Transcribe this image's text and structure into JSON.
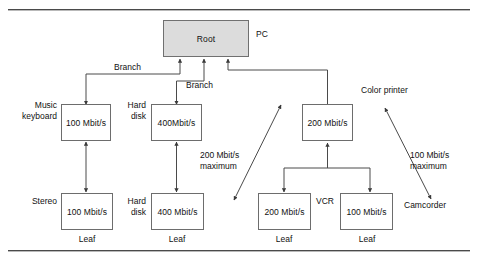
{
  "figure": {
    "colors": {
      "root_fill": "#dcdcdc",
      "box_stroke": "#6d6d6d",
      "line": "#4a4a4a",
      "text": "#111111",
      "background": "#ffffff"
    },
    "rules": [
      {
        "name": "top-rule",
        "y": 9
      },
      {
        "name": "bottom-rule",
        "y": 250
      }
    ]
  },
  "nodes": {
    "root": {
      "label": "Root",
      "x": 163,
      "y": 20,
      "w": 86,
      "h": 37
    },
    "music_keyboard": {
      "label": "100 Mbit/s",
      "x": 61,
      "y": 104,
      "w": 50,
      "h": 37
    },
    "hard_disk_top": {
      "label": "400Mbit/s",
      "x": 151,
      "y": 104,
      "w": 51,
      "h": 37
    },
    "hub_200": {
      "label": "200 Mbit/s",
      "x": 302,
      "y": 104,
      "w": 51,
      "h": 37
    },
    "stereo": {
      "label": "100 Mbit/s",
      "x": 61,
      "y": 193,
      "w": 52,
      "h": 37
    },
    "hard_disk_bottom": {
      "label": "400 Mbit/s",
      "x": 151,
      "y": 193,
      "w": 53,
      "h": 37
    },
    "vcr": {
      "label": "200 Mbit/s",
      "x": 258,
      "y": 193,
      "w": 53,
      "h": 37
    },
    "camcorder_leaf": {
      "label": "100 Mbit/s",
      "x": 340,
      "y": 193,
      "w": 53,
      "h": 37
    }
  },
  "annotations": {
    "pc": {
      "text": "PC",
      "x": 256,
      "y": 29
    },
    "branch_1": {
      "text": "Branch",
      "x": 114,
      "y": 62
    },
    "branch_2": {
      "text": "Branch",
      "x": 186,
      "y": 80
    },
    "music_keyboard_label": {
      "line1": "Music",
      "line2": "keyboard",
      "x": 9,
      "y": 100
    },
    "hard_disk_top_label": {
      "line1": "Hard",
      "line2": "disk",
      "x": 122,
      "y": 100
    },
    "color_printer_label": {
      "text": "Color printer",
      "x": 361,
      "y": 88
    },
    "stereo_label": {
      "text": "Stereo",
      "x": 24,
      "y": 196
    },
    "hard_disk_bottom_label": {
      "line1": "Hard",
      "line2": "disk",
      "x": 112,
      "y": 196
    },
    "vcr_label": {
      "text": "VCR",
      "x": 316,
      "y": 196
    },
    "camcorder_label": {
      "text": "Camcorder",
      "x": 407,
      "y": 200
    },
    "max_200": {
      "line1": "200 Mbit/s",
      "line2": "maximum",
      "x": 201,
      "y": 152
    },
    "max_100": {
      "line1": "100 Mbit/s",
      "line2": "maximum",
      "x": 410,
      "y": 152
    },
    "leaf_1": {
      "text": "Leaf",
      "x": 75,
      "y": 234
    },
    "leaf_2": {
      "text": "Leaf",
      "x": 166,
      "y": 234
    },
    "leaf_3": {
      "text": "Leaf",
      "x": 274,
      "y": 234
    },
    "leaf_4": {
      "text": "Leaf",
      "x": 356,
      "y": 234
    }
  },
  "connections": [
    {
      "name": "root-to-music-keyboard",
      "type": "branch",
      "from": "root",
      "to": "music_keyboard"
    },
    {
      "name": "root-to-hard-disk",
      "type": "branch",
      "from": "root",
      "to": "hard_disk_top"
    },
    {
      "name": "root-to-hub-200",
      "type": "branch",
      "from": "root",
      "to": "hub_200"
    },
    {
      "name": "music-keyboard-to-stereo",
      "type": "double-arrow",
      "from": "music_keyboard",
      "to": "stereo"
    },
    {
      "name": "hard-disk-top-to-bottom",
      "type": "double-arrow",
      "from": "hard_disk_top",
      "to": "hard_disk_bottom"
    },
    {
      "name": "hub-200-to-vcr",
      "type": "branch",
      "from": "hub_200",
      "to": "vcr"
    },
    {
      "name": "hub-200-to-camcorder-leaf",
      "type": "branch",
      "from": "hub_200",
      "to": "camcorder_leaf"
    },
    {
      "name": "diagonal-200-max",
      "type": "double-arrow-diagonal",
      "label": "200 Mbit/s maximum"
    },
    {
      "name": "diagonal-100-max",
      "type": "double-arrow-diagonal",
      "label": "100 Mbit/s maximum"
    }
  ]
}
